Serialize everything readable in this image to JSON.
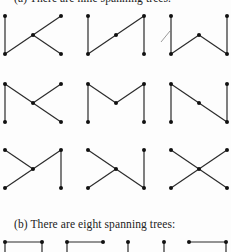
{
  "captions": {
    "a": "(a)  There are nine spanning trees.",
    "b": "(b)  There are eight spanning trees:"
  },
  "colors": {
    "edge": "#2b2b2b",
    "node": "#111111",
    "background": "#fdfdfd",
    "artifact": "#9a9a9a"
  },
  "part_a": {
    "vertex_labels": [
      "TL",
      "BL",
      "C",
      "TR",
      "BR"
    ],
    "trees": [
      {
        "row": 0,
        "col": 0,
        "edges": [
          [
            "TL",
            "BL"
          ],
          [
            "BL",
            "C"
          ],
          [
            "C",
            "TR"
          ],
          [
            "C",
            "BR"
          ]
        ]
      },
      {
        "row": 0,
        "col": 1,
        "edges": [
          [
            "TL",
            "BL"
          ],
          [
            "BL",
            "C"
          ],
          [
            "C",
            "TR"
          ],
          [
            "TR",
            "BR"
          ]
        ]
      },
      {
        "row": 0,
        "col": 2,
        "edges": [
          [
            "TL",
            "BL"
          ],
          [
            "BL",
            "C"
          ],
          [
            "C",
            "BR"
          ],
          [
            "TR",
            "BR"
          ]
        ]
      },
      {
        "row": 1,
        "col": 0,
        "edges": [
          [
            "TL",
            "BL"
          ],
          [
            "TL",
            "C"
          ],
          [
            "C",
            "TR"
          ],
          [
            "C",
            "BR"
          ]
        ]
      },
      {
        "row": 1,
        "col": 1,
        "edges": [
          [
            "TL",
            "BL"
          ],
          [
            "TL",
            "C"
          ],
          [
            "C",
            "TR"
          ],
          [
            "TR",
            "BR"
          ]
        ]
      },
      {
        "row": 1,
        "col": 2,
        "edges": [
          [
            "TL",
            "BL"
          ],
          [
            "TL",
            "C"
          ],
          [
            "C",
            "BR"
          ],
          [
            "TR",
            "BR"
          ]
        ]
      },
      {
        "row": 2,
        "col": 0,
        "edges": [
          [
            "TL",
            "C"
          ],
          [
            "BL",
            "C"
          ],
          [
            "C",
            "TR"
          ],
          [
            "TR",
            "BR"
          ]
        ]
      },
      {
        "row": 2,
        "col": 1,
        "edges": [
          [
            "TL",
            "C"
          ],
          [
            "BL",
            "C"
          ],
          [
            "C",
            "BR"
          ],
          [
            "TR",
            "BR"
          ]
        ]
      },
      {
        "row": 2,
        "col": 2,
        "edges": [
          [
            "TL",
            "C"
          ],
          [
            "BL",
            "C"
          ],
          [
            "C",
            "TR"
          ],
          [
            "C",
            "BR"
          ]
        ]
      }
    ]
  },
  "part_b_partial": [
    {
      "nodes": [
        [
          5,
          242
        ],
        [
          42,
          242
        ]
      ],
      "segments": [
        [
          [
            5,
            242
          ],
          [
            42,
            242
          ]
        ],
        [
          [
            5,
            242
          ],
          [
            5,
            252
          ]
        ],
        [
          [
            42,
            242
          ],
          [
            42,
            252
          ]
        ]
      ]
    },
    {
      "nodes": [
        [
          67,
          242
        ],
        [
          103,
          242
        ]
      ],
      "segments": [
        [
          [
            67,
            242
          ],
          [
            103,
            242
          ]
        ],
        [
          [
            67,
            242
          ],
          [
            67,
            252
          ]
        ]
      ]
    },
    {
      "nodes": [
        [
          128,
          242
        ]
      ],
      "segments": [
        [
          [
            128,
            242
          ],
          [
            128,
            252
          ]
        ]
      ]
    },
    {
      "nodes": [
        [
          164,
          242
        ]
      ],
      "segments": [
        [
          [
            164,
            242
          ],
          [
            164,
            252
          ]
        ]
      ]
    },
    {
      "nodes": [
        [
          189,
          242
        ],
        [
          226,
          242
        ]
      ],
      "segments": [
        [
          [
            189,
            242
          ],
          [
            226,
            242
          ]
        ],
        [
          [
            226,
            242
          ],
          [
            226,
            252
          ]
        ]
      ]
    }
  ]
}
